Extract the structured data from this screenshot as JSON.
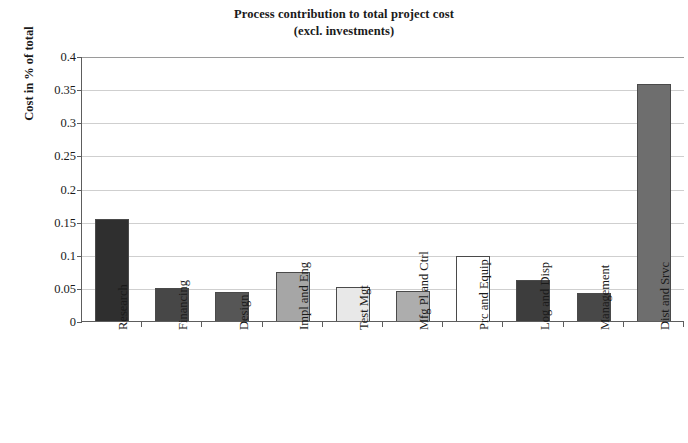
{
  "chart": {
    "title_line1": "Process contribution to total project cost",
    "title_line2": "(excl. investments)"
  },
  "chart_data": {
    "type": "bar",
    "title": "Process contribution to total project cost (excl. investments)",
    "xlabel": "",
    "ylabel": "Cost in % of total",
    "ylim": [
      0,
      0.4
    ],
    "ytick_labels": [
      "0.4",
      "0.35",
      "0.3",
      "0.25",
      "0.2",
      "0.15",
      "0.1",
      "0.05",
      "0"
    ],
    "ytick_values": [
      0.4,
      0.35,
      0.3,
      0.25,
      0.2,
      0.15,
      0.1,
      0.05,
      0
    ],
    "grid": true,
    "legend": "none",
    "categories": [
      "Research",
      "Financing",
      "Design",
      "Impl and Eng",
      "Test Mgt",
      "Mfg Pl and Ctrl",
      "Prc and Equip",
      "Log and Disp",
      "Management",
      "Dist and Srvc"
    ],
    "values": [
      0.155,
      0.051,
      0.045,
      0.076,
      0.053,
      0.047,
      0.099,
      0.063,
      0.044,
      0.359
    ],
    "bar_colors": [
      "#2f2f2f",
      "#474747",
      "#565656",
      "#a6a6a6",
      "#e8e8e8",
      "#adadad",
      "#ffffff",
      "#3d3d3d",
      "#484848",
      "#6e6e6e"
    ],
    "bar_border_color": "#4a4a4a"
  }
}
